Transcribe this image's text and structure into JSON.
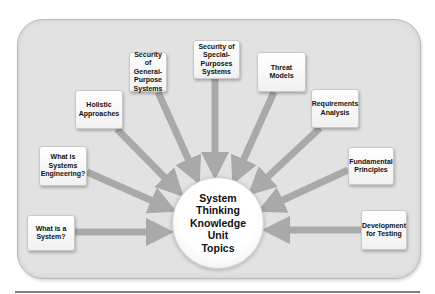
{
  "diagram": {
    "type": "hub-and-spoke",
    "hub": {
      "label_lines": [
        "System",
        "Thinking",
        "Knowledge",
        "Unit",
        "Topics"
      ],
      "label": "System Thinking Knowledge Unit Topics"
    },
    "topics": [
      {
        "id": "what-is-a-system",
        "label": "What is a System?"
      },
      {
        "id": "what-is-systems-engineering",
        "label": "What is Systems Engineering?"
      },
      {
        "id": "holistic-approaches",
        "label": "Holistic Approaches"
      },
      {
        "id": "security-general-purpose",
        "label": "Security of General-Purpose Systems"
      },
      {
        "id": "security-special-purposes",
        "label": "Security of Special-Purposes Systems"
      },
      {
        "id": "threat-models",
        "label": "Threat Models"
      },
      {
        "id": "requirements-analysis",
        "label": "Requirements Analysis"
      },
      {
        "id": "fundamental-principles",
        "label": "Fundamental Principles"
      },
      {
        "id": "development-for-testing",
        "label": "Development for Testing"
      }
    ],
    "colors": {
      "panel": "#e2e2e2",
      "arrow": "#a9a9a9",
      "box": "#ffffff",
      "text": "#111111"
    }
  }
}
